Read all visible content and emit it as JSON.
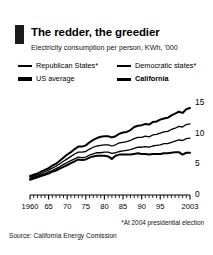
{
  "header": {
    "brand_bar_color": "#1a1a1a",
    "title": "The redder, the greedier",
    "subtitle": "Electricity consumption per person, KWh, '000"
  },
  "legend": {
    "items": [
      {
        "label": "Republican States*",
        "weight": "thin",
        "bold": false,
        "col": 1,
        "row": 1
      },
      {
        "label": "Democratic states*",
        "weight": "thin",
        "bold": false,
        "col": 2,
        "row": 1
      },
      {
        "label": "US average",
        "weight": "thick",
        "bold": false,
        "col": 1,
        "row": 2
      },
      {
        "label": "California",
        "weight": "med",
        "bold": true,
        "col": 2,
        "row": 2
      }
    ]
  },
  "footnote": "*At 2004 presidential election",
  "source": "Source: California Energy Comission",
  "chart_data": {
    "type": "line",
    "title": "The redder, the greedier",
    "subtitle": "Electricity consumption per person, KWh, '000",
    "xlabel": "",
    "ylabel": "KWh, '000",
    "xlim": [
      1960,
      2003
    ],
    "ylim": [
      0,
      16
    ],
    "yticks": [
      0,
      5,
      10,
      15
    ],
    "ytick_labels": [
      "0",
      "5",
      "10",
      "15"
    ],
    "y_axis_position": "right",
    "xticks": [
      1960,
      1965,
      1970,
      1975,
      1980,
      1985,
      1990,
      1995,
      2003
    ],
    "xtick_labels": [
      "1960",
      "65",
      "70",
      "75",
      "80",
      "85",
      "90",
      "95",
      "2003"
    ],
    "minor_xticks": "annual",
    "grid": false,
    "legend_position": "above-plot",
    "x": [
      1960,
      1961,
      1962,
      1963,
      1964,
      1965,
      1966,
      1967,
      1968,
      1969,
      1970,
      1971,
      1972,
      1973,
      1974,
      1975,
      1976,
      1977,
      1978,
      1979,
      1980,
      1981,
      1982,
      1983,
      1984,
      1985,
      1986,
      1987,
      1988,
      1989,
      1990,
      1991,
      1992,
      1993,
      1994,
      1995,
      1996,
      1997,
      1998,
      1999,
      2000,
      2001,
      2002,
      2003
    ],
    "series": [
      {
        "name": "US average",
        "style": "thick",
        "color": "#000000",
        "values": [
          3.1,
          3.3,
          3.5,
          3.8,
          4.1,
          4.4,
          4.8,
          5.1,
          5.6,
          6.1,
          6.6,
          7.0,
          7.5,
          7.9,
          7.9,
          8.1,
          8.6,
          9.0,
          9.3,
          9.5,
          9.6,
          9.6,
          9.4,
          9.6,
          10.0,
          10.2,
          10.3,
          10.6,
          11.1,
          11.3,
          11.4,
          11.6,
          11.5,
          11.9,
          12.0,
          12.3,
          12.5,
          12.6,
          13.0,
          13.3,
          13.6,
          13.4,
          14.0,
          14.2
        ]
      },
      {
        "name": "Republican States*",
        "style": "thin",
        "color": "#000000",
        "values": [
          2.9,
          3.1,
          3.3,
          3.5,
          3.8,
          4.1,
          4.4,
          4.7,
          5.1,
          5.5,
          5.9,
          6.3,
          6.7,
          7.0,
          7.0,
          7.1,
          7.5,
          7.8,
          8.0,
          8.1,
          8.2,
          8.2,
          8.0,
          8.2,
          8.5,
          8.6,
          8.7,
          8.9,
          9.2,
          9.4,
          9.4,
          9.6,
          9.5,
          9.8,
          9.9,
          10.1,
          10.3,
          10.4,
          10.7,
          10.9,
          11.2,
          11.1,
          11.5,
          11.6
        ]
      },
      {
        "name": "Democratic states*",
        "style": "thin",
        "color": "#000000",
        "values": [
          2.7,
          2.9,
          3.1,
          3.3,
          3.5,
          3.8,
          4.0,
          4.3,
          4.6,
          5.0,
          5.3,
          5.6,
          5.9,
          6.2,
          6.1,
          6.2,
          6.5,
          6.7,
          6.9,
          6.9,
          7.0,
          7.0,
          6.8,
          6.9,
          7.1,
          7.2,
          7.3,
          7.4,
          7.6,
          7.8,
          7.8,
          7.9,
          7.8,
          8.0,
          8.1,
          8.2,
          8.4,
          8.4,
          8.6,
          8.8,
          9.0,
          8.9,
          9.2,
          9.3
        ]
      },
      {
        "name": "California",
        "style": "med-bold",
        "color": "#000000",
        "values": [
          2.5,
          2.7,
          2.9,
          3.1,
          3.3,
          3.5,
          3.8,
          4.0,
          4.3,
          4.6,
          4.9,
          5.2,
          5.5,
          5.8,
          5.7,
          5.8,
          6.1,
          6.3,
          6.4,
          6.4,
          6.4,
          6.3,
          5.9,
          6.4,
          6.6,
          6.6,
          6.6,
          6.6,
          6.7,
          6.8,
          6.7,
          6.7,
          6.6,
          6.7,
          6.7,
          6.7,
          6.8,
          6.8,
          6.9,
          7.0,
          7.0,
          6.6,
          6.9,
          6.9
        ]
      }
    ]
  }
}
